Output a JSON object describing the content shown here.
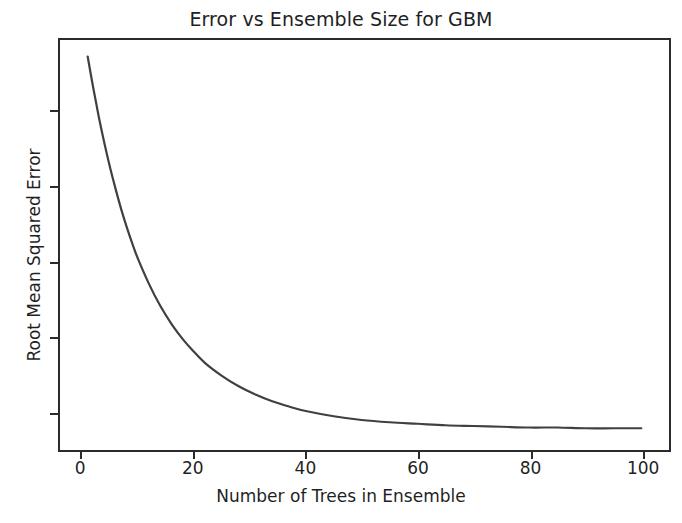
{
  "chart_data": {
    "type": "line",
    "title": "Error vs Ensemble Size for GBM",
    "xlabel": "Number of Trees in Ensemble",
    "ylabel": "Root Mean Squared Error",
    "xlim": [
      -3.95,
      104.95
    ],
    "ylim": [
      0.5,
      5.97
    ],
    "grid": false,
    "legend": null,
    "line_color": "#404040",
    "line_width": 2.2,
    "series": [
      {
        "name": "RMSE",
        "x": [
          1,
          2,
          3,
          4,
          5,
          6,
          7,
          8,
          9,
          10,
          12,
          14,
          16,
          18,
          20,
          22,
          25,
          28,
          31,
          34,
          37,
          40,
          45,
          50,
          55,
          60,
          65,
          70,
          75,
          80,
          85,
          90,
          95,
          100
        ],
        "values": [
          5.75,
          5.33,
          4.94,
          4.59,
          4.27,
          3.98,
          3.71,
          3.47,
          3.25,
          3.05,
          2.71,
          2.42,
          2.18,
          1.98,
          1.81,
          1.66,
          1.49,
          1.35,
          1.24,
          1.15,
          1.08,
          1.02,
          0.95,
          0.9,
          0.87,
          0.85,
          0.83,
          0.82,
          0.81,
          0.8,
          0.8,
          0.79,
          0.79,
          0.79
        ]
      }
    ],
    "xticks": [
      0,
      20,
      40,
      60,
      80,
      100
    ],
    "xtick_labels": [
      "0",
      "20",
      "40",
      "60",
      "80",
      "100"
    ],
    "yticks": [
      1,
      2,
      3,
      4,
      5
    ],
    "ytick_labels": [
      "1",
      "2",
      "3",
      "4",
      "5"
    ]
  }
}
